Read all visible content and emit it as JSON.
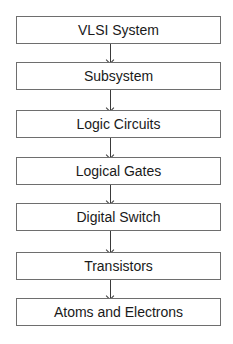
{
  "diagram": {
    "type": "flowchart",
    "direction": "top-to-bottom",
    "nodes": [
      {
        "label": "VLSI System"
      },
      {
        "label": "Subsystem"
      },
      {
        "label": "Logic Circuits"
      },
      {
        "label": "Logical Gates"
      },
      {
        "label": "Digital Switch"
      },
      {
        "label": "Transistors"
      },
      {
        "label": "Atoms and Electrons"
      }
    ],
    "edges": [
      {
        "from": 0,
        "to": 1
      },
      {
        "from": 1,
        "to": 2
      },
      {
        "from": 2,
        "to": 3
      },
      {
        "from": 3,
        "to": 4
      },
      {
        "from": 4,
        "to": 5
      },
      {
        "from": 5,
        "to": 6
      }
    ]
  }
}
